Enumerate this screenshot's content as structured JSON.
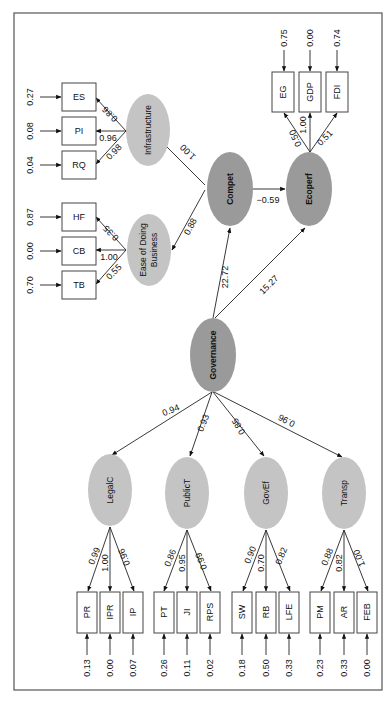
{
  "diagram": {
    "type": "structural-equation-model",
    "orientation": "rotated-90-ccw",
    "colors": {
      "second_order_fill": "#9a9a9a",
      "first_order_fill": "#c4c4c4",
      "indicator_box_fill": "#ffffff",
      "line": "#222222"
    },
    "latent": {
      "governance": "Governance",
      "compet": "Compet",
      "ecoperf": "Ecoperf",
      "infrastructure": "Infrastructure",
      "ease_line1": "Ease of Doing",
      "ease_line2": "Business",
      "legalc": "LegalC",
      "publict": "PublicT",
      "govef": "GovEf",
      "transp": "Transp"
    },
    "structural_paths": {
      "gov_legalc": "0.94",
      "gov_publict": "0.93",
      "gov_govef": "0.85",
      "gov_transp": "0.96",
      "gov_compet": "22.72",
      "gov_ecoperf": "15.27",
      "compet_ecoperf": "−0.59",
      "compet_infra": "1.00",
      "compet_ease": "0.88"
    },
    "indicators": {
      "ES": {
        "label": "ES",
        "loading": "0.86",
        "error": "0.27"
      },
      "PI": {
        "label": "PI",
        "loading": "0.96",
        "error": "0.08"
      },
      "RQ": {
        "label": "RQ",
        "loading": "0.98",
        "error": "0.04"
      },
      "HF": {
        "label": "HF",
        "loading": "0.35",
        "error": "0.87"
      },
      "CB": {
        "label": "CB",
        "loading": "1.00",
        "error": "0.00"
      },
      "TB": {
        "label": "TB",
        "loading": "0.55",
        "error": "0.70"
      },
      "EG": {
        "label": "EG",
        "loading": "0.50",
        "error": "0.75"
      },
      "GDP": {
        "label": "GDP",
        "loading": "1.00",
        "error": "0.00"
      },
      "FDI": {
        "label": "FDI",
        "loading": "0.51",
        "error": "0.74"
      },
      "PR": {
        "label": "PR",
        "loading": "0.99",
        "error": "0.13"
      },
      "IPR": {
        "label": "IPR",
        "loading": "1.00",
        "error": "0.00"
      },
      "IP": {
        "label": "IP",
        "loading": "0.96",
        "error": "0.07"
      },
      "PT": {
        "label": "PT",
        "loading": "0.86",
        "error": "0.26"
      },
      "JI": {
        "label": "JI",
        "loading": "0.95",
        "error": "0.11"
      },
      "RPS": {
        "label": "RPS",
        "loading": "0.99",
        "error": "0.02"
      },
      "SW": {
        "label": "SW",
        "loading": "0.90",
        "error": "0.18"
      },
      "RB": {
        "label": "RB",
        "loading": "0.70",
        "error": "0.50"
      },
      "LFE": {
        "label": "LFE",
        "loading": "0.82",
        "error": "0.33"
      },
      "PM": {
        "label": "PM",
        "loading": "0.88",
        "error": "0.23"
      },
      "AR": {
        "label": "AR",
        "loading": "0.82",
        "error": "0.33"
      },
      "FEB": {
        "label": "FEB",
        "loading": "1.00",
        "error": "0.00"
      }
    }
  }
}
